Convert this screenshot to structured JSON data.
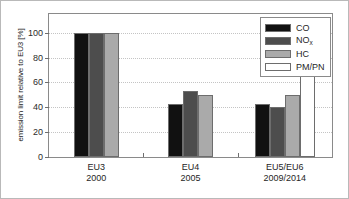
{
  "chart_data": {
    "type": "bar",
    "title": "",
    "xlabel": "",
    "ylabel": "emission limit relative to EU3 [%]",
    "ylim": [
      0,
      115
    ],
    "yticks": [
      0,
      20,
      40,
      60,
      80,
      100
    ],
    "ytick_labels": [
      "0",
      "20",
      "40",
      "60",
      "80",
      "100"
    ],
    "grid": true,
    "grid_style": "dotted-horizontal",
    "legend_position": "top-right",
    "categories": [
      "EU3",
      "EU4",
      "EU5/EU6"
    ],
    "category_sublabels": [
      "2000",
      "2005",
      "2009/2014"
    ],
    "series": [
      {
        "name": "CO",
        "color": "#111111",
        "values": [
          100,
          43,
          43
        ]
      },
      {
        "name": "NOx",
        "color": "#4d4d4d",
        "values": [
          100,
          53,
          40
        ]
      },
      {
        "name": "HC",
        "color": "#aaaaaa",
        "values": [
          100,
          50,
          50
        ]
      },
      {
        "name": "PM/PN",
        "color": "#ffffff",
        "values": [
          null,
          null,
          100
        ]
      }
    ]
  },
  "legend": {
    "items": [
      {
        "label": "CO",
        "sub": "",
        "color": "#111111"
      },
      {
        "label": "NO",
        "sub": "x",
        "color": "#4d4d4d"
      },
      {
        "label": "HC",
        "sub": "",
        "color": "#aaaaaa"
      },
      {
        "label": "PM/PN",
        "sub": "",
        "color": "#ffffff"
      }
    ]
  },
  "axes": {
    "y_title": "emission limit relative to EU3 [%]",
    "y_tick_labels": [
      "100",
      "80",
      "60",
      "40",
      "20",
      "0"
    ],
    "x_group_labels": [
      {
        "line1": "EU3",
        "line2": "2000"
      },
      {
        "line1": "EU4",
        "line2": "2005"
      },
      {
        "line1": "EU5/EU6",
        "line2": "2009/2014"
      }
    ]
  }
}
